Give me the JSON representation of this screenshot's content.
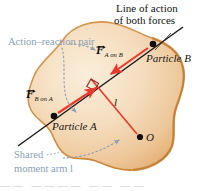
{
  "figure": {
    "title": "Line of action of both forces",
    "title_line1": "Line of action",
    "title_line2": "of both forces",
    "annotations": {
      "action_reaction": "Action–reaction pair",
      "shared_moment_line1": "Shared",
      "shared_moment_line2": "moment arm l",
      "shared_moment_full": "Shared moment arm l"
    },
    "labels": {
      "particle_a": "Particle A",
      "particle_b": "Particle B",
      "point_o": "O",
      "moment_arm": "l"
    },
    "forces": [
      {
        "name": "force-a-on-b",
        "symbol": "F",
        "subscript": "A on B",
        "direction": "down-left",
        "color": "#e8392c"
      },
      {
        "name": "force-b-on-a",
        "symbol": "F",
        "subscript": "B on A",
        "direction": "up-right",
        "color": "#e8392c"
      }
    ],
    "colors": {
      "body_fill_light": "#f6e4cc",
      "body_fill_mid": "#f0cfa4",
      "body_fill_dark": "#e8b679",
      "body_outline": "#cf8b3e",
      "force_red": "#e8392c",
      "line_of_action": "#1b1b1b",
      "annotation_blue": "#8a9fb4",
      "dot_black": "#101010"
    },
    "bottom_cut_text": "——  ————  —— ——"
  }
}
